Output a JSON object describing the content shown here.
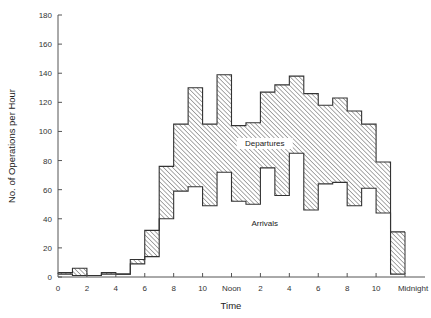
{
  "chart_data": {
    "type": "bar",
    "subtype": "stepped-histogram-band",
    "title": "",
    "xlabel": "Time",
    "ylabel": "No. of Operations per Hour",
    "ylim": [
      0,
      180
    ],
    "yticks": [
      0,
      20,
      40,
      60,
      80,
      100,
      120,
      140,
      160,
      180
    ],
    "xlim_hours": [
      0,
      24
    ],
    "xticks": [
      {
        "hour": 0,
        "label": "0"
      },
      {
        "hour": 2,
        "label": "2"
      },
      {
        "hour": 4,
        "label": "4"
      },
      {
        "hour": 6,
        "label": "6"
      },
      {
        "hour": 8,
        "label": "8"
      },
      {
        "hour": 10,
        "label": "10"
      },
      {
        "hour": 12,
        "label": "Noon"
      },
      {
        "hour": 14,
        "label": "2"
      },
      {
        "hour": 16,
        "label": "4"
      },
      {
        "hour": 18,
        "label": "6"
      },
      {
        "hour": 20,
        "label": "8"
      },
      {
        "hour": 22,
        "label": "10"
      },
      {
        "hour": 24,
        "label": "Midnight"
      }
    ],
    "grid": false,
    "legend": "none (inline labels)",
    "annotations": [
      {
        "text": "Departures",
        "hour": 14.3,
        "value": 90
      },
      {
        "text": "Arrivals",
        "hour": 14.3,
        "value": 35
      }
    ],
    "categories": [
      "0-1",
      "1-2",
      "2-3",
      "3-4",
      "4-5",
      "5-6",
      "6-7",
      "7-8",
      "8-9",
      "9-10",
      "10-11",
      "11-12",
      "12-13",
      "13-14",
      "14-15",
      "15-16",
      "16-17",
      "17-18",
      "18-19",
      "19-20",
      "20-21",
      "21-22",
      "22-23",
      "23-24"
    ],
    "series": [
      {
        "name": "Arrivals",
        "description": "lower boundary of hatched band",
        "values": [
          2,
          1,
          1,
          2,
          2,
          9,
          14,
          40,
          59,
          62,
          49,
          72,
          52,
          50,
          75,
          56,
          85,
          46,
          64,
          65,
          49,
          61,
          44,
          2
        ]
      },
      {
        "name": "Departures (cumulative top, Arrivals + Departures)",
        "description": "upper boundary of hatched band; hatched area represents departures",
        "values": [
          3,
          6,
          1,
          3,
          2,
          12,
          32,
          76,
          105,
          130,
          105,
          139,
          104,
          106,
          127,
          132,
          138,
          126,
          118,
          123,
          114,
          105,
          79,
          31
        ]
      }
    ]
  }
}
